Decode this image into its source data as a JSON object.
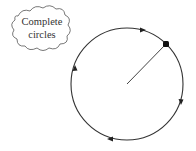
{
  "cloud": {
    "line1": "Complete",
    "line2": "circles"
  },
  "diagram": {
    "circle": {
      "cx": 127,
      "cy": 84,
      "r": 56,
      "stroke": "#333333"
    },
    "radius_line": {
      "x1": 127,
      "y1": 84,
      "x2": 166,
      "y2": 44
    },
    "point": {
      "cx": 166,
      "cy": 44
    },
    "direction": "clockwise",
    "arrow_count": 4
  }
}
